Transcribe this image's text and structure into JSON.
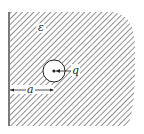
{
  "diagram": {
    "labels": {
      "permittivity": "ε",
      "charge": "q",
      "distance": "a"
    },
    "colors": {
      "ink": "#222222",
      "hatch": "#555555",
      "background": "#ffffff"
    },
    "geometry": {
      "wall_x": 9,
      "cavity_center": [
        54,
        71
      ],
      "cavity_radius": 11
    }
  }
}
